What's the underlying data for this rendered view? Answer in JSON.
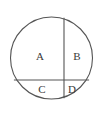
{
  "figure": {
    "type": "geometry-diagram",
    "background_color": "#ffffff",
    "stroke_color": "#555555",
    "label_color": "#3a3a3a",
    "stroke_width": 1.1,
    "circle": {
      "cx": 51.5,
      "cy": 58,
      "r": 41
    },
    "chords": [
      {
        "name": "vertical-chord",
        "orientation": "vertical",
        "x1": 64,
        "y1": 17.7,
        "x2": 64,
        "y2": 98.3
      },
      {
        "name": "horizontal-chord",
        "orientation": "horizontal",
        "x1": 13.9,
        "y1": 80,
        "x2": 89.1,
        "y2": 80
      }
    ],
    "regions": [
      {
        "id": "region-a",
        "label": "A",
        "x": 40,
        "y": 57
      },
      {
        "id": "region-b",
        "label": "B",
        "x": 77,
        "y": 57
      },
      {
        "id": "region-c",
        "label": "C",
        "x": 42,
        "y": 90
      },
      {
        "id": "region-d",
        "label": "D",
        "x": 72,
        "y": 90
      }
    ]
  }
}
